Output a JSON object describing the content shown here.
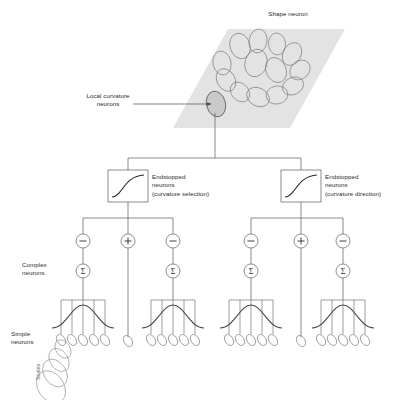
{
  "figure": {
    "title_top": "Shape neuron",
    "background_color": "#ffffff",
    "line_color": "#5a5a66",
    "text_color": "#2b2b2b",
    "plane_fill": "#e2e2e2"
  },
  "labels": {
    "shape_neuron": "Shape neuron",
    "local_curvature_neurons": "Local curvature\nneurons",
    "endstopped_left": "Endstopped\nneurons\n(curvature selection)",
    "endstopped_right": "Endstopped\nneurons\n(curvature direction)",
    "complex_neurons": "Complex\nneurons",
    "simple_neurons": "Simple\nneurons",
    "scales": "Scales"
  },
  "branches": [
    {
      "id": "curvature-selection",
      "box_label": "Endstopped\nneurons\n(curvature selection)",
      "box_icon": "sigmoid-curve",
      "signs": [
        "−",
        "+",
        "−"
      ],
      "sum_symbol": "Σ",
      "sum_count": 2,
      "simple_groups": [
        {
          "id": "left",
          "ellipse_count": 5,
          "has_gaussian": true
        },
        {
          "id": "center",
          "ellipse_count": 1,
          "has_gaussian": false
        },
        {
          "id": "right",
          "ellipse_count": 5,
          "has_gaussian": true
        }
      ]
    },
    {
      "id": "curvature-direction",
      "box_label": "Endstopped\nneurons\n(curvature direction)",
      "box_icon": "sigmoid-curve",
      "signs": [
        "−",
        "+",
        "−"
      ],
      "sum_symbol": "Σ",
      "sum_count": 2,
      "simple_groups": [
        {
          "id": "left",
          "ellipse_count": 5,
          "has_gaussian": true
        },
        {
          "id": "center",
          "ellipse_count": 1,
          "has_gaussian": false
        },
        {
          "id": "right",
          "ellipse_count": 5,
          "has_gaussian": true
        }
      ]
    }
  ],
  "scale_cascade": {
    "ellipse_count": 4,
    "label": "Scales"
  },
  "shape_plane": {
    "receptive_field_count": 14,
    "highlight_index": 13
  }
}
